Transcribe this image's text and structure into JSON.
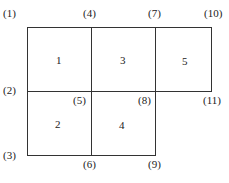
{
  "diagram": {
    "type": "finite-element mesh",
    "elements": [
      {
        "id": "1",
        "x": 59,
        "y": 55
      },
      {
        "id": "2",
        "x": 58,
        "y": 119
      },
      {
        "id": "3",
        "x": 123,
        "y": 55
      },
      {
        "id": "4",
        "x": 122,
        "y": 120
      },
      {
        "id": "5",
        "x": 185,
        "y": 56
      }
    ],
    "nodes": [
      {
        "id": "(1)",
        "x": 3,
        "y": 8
      },
      {
        "id": "(2)",
        "x": 3,
        "y": 85
      },
      {
        "id": "(3)",
        "x": 3,
        "y": 150
      },
      {
        "id": "(4)",
        "x": 83,
        "y": 8
      },
      {
        "id": "(5)",
        "x": 73,
        "y": 95
      },
      {
        "id": "(6)",
        "x": 83,
        "y": 159
      },
      {
        "id": "(7)",
        "x": 148,
        "y": 8
      },
      {
        "id": "(8)",
        "x": 138,
        "y": 95
      },
      {
        "id": "(9)",
        "x": 148,
        "y": 159
      },
      {
        "id": "(10)",
        "x": 204,
        "y": 8
      },
      {
        "id": "(11)",
        "x": 203,
        "y": 95
      }
    ],
    "line_color": "#333333"
  }
}
